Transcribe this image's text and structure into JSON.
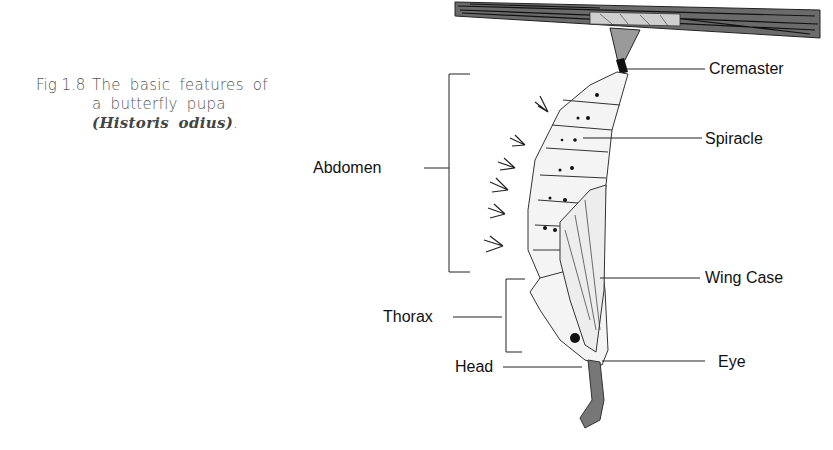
{
  "caption": {
    "figure_number": "Fig 1.8",
    "text": "The basic features of a butterfly pupa ",
    "scientific_name": "(Historis odius)",
    "end": "."
  },
  "labels": {
    "cremaster": "Cremaster",
    "spiracle": "Spiracle",
    "abdomen": "Abdomen",
    "wing_case": "Wing Case",
    "thorax": "Thorax",
    "eye": "Eye",
    "head": "Head"
  }
}
